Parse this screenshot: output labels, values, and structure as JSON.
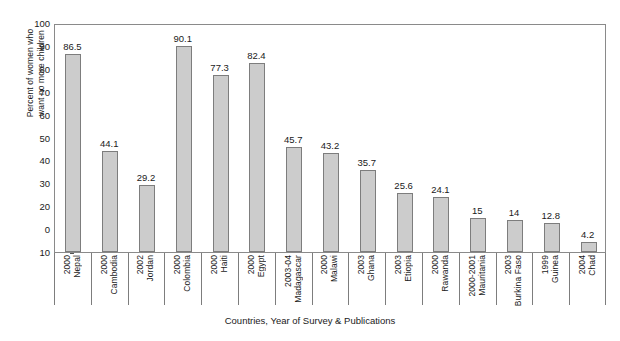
{
  "chart_data": {
    "type": "bar",
    "title": "",
    "xlabel": "Countries, Year of Survey & Publications",
    "ylabel": "Percent of women who want no more children",
    "ylabel_line1": "Percent of women who",
    "ylabel_line2": "want no more children",
    "grid": false,
    "legend": "none",
    "ylim": [
      0,
      100
    ],
    "ytick_labels": [
      "100",
      "90",
      "80",
      "70",
      "60",
      "50",
      "40",
      "30",
      "20",
      "0",
      "10"
    ],
    "ytick_values": [
      100,
      90,
      80,
      70,
      60,
      50,
      40,
      30,
      20,
      10,
      0
    ],
    "categories": [
      "2000 Nepal",
      "2000 Cambodia",
      "2002 Jordan",
      "2000 Colombia",
      "2000 Haiti",
      "2000 Egypt",
      "2003-04 Madagascar",
      "2000 Malawi",
      "2003 Ghana",
      "2003 Etiopia",
      "2000 Rawanda",
      "2000-2001 Mauritania",
      "2003 Burkina Faso",
      "1999 Guinea",
      "2004 Chad"
    ],
    "values": [
      86.5,
      44.1,
      29.2,
      90.1,
      77.3,
      82.4,
      45.7,
      43.2,
      35.7,
      25.6,
      24.1,
      15,
      14,
      12.8,
      4.2
    ],
    "value_labels": [
      "86.5",
      "44.1",
      "29.2",
      "90.1",
      "77.3",
      "82.4",
      "45.7",
      "43.2",
      "35.7",
      "25.6",
      "24.1",
      "15",
      "14",
      "12.8",
      "4.2"
    ],
    "bars": [
      {
        "year": "2000",
        "country": "Nepal",
        "value": 86.5,
        "label": "86.5"
      },
      {
        "year": "2000",
        "country": "Cambodia",
        "value": 44.1,
        "label": "44.1"
      },
      {
        "year": "2002",
        "country": "Jordan",
        "value": 29.2,
        "label": "29.2"
      },
      {
        "year": "2000",
        "country": "Colombia",
        "value": 90.1,
        "label": "90.1"
      },
      {
        "year": "2000",
        "country": "Haiti",
        "value": 77.3,
        "label": "77.3"
      },
      {
        "year": "2000",
        "country": "Egypt",
        "value": 82.4,
        "label": "82.4"
      },
      {
        "year": "2003-04",
        "country": "Madagascar",
        "value": 45.7,
        "label": "45.7"
      },
      {
        "year": "2000",
        "country": "Malawi",
        "value": 43.2,
        "label": "43.2"
      },
      {
        "year": "2003",
        "country": "Ghana",
        "value": 35.7,
        "label": "35.7"
      },
      {
        "year": "2003",
        "country": "Etiopia",
        "value": 25.6,
        "label": "25.6"
      },
      {
        "year": "2000",
        "country": "Rawanda",
        "value": 24.1,
        "label": "24.1"
      },
      {
        "year": "2000-2001",
        "country": "Mauritania",
        "value": 15,
        "label": "15"
      },
      {
        "year": "2003",
        "country": "Burkina Faso",
        "value": 14,
        "label": "14"
      },
      {
        "year": "1999",
        "country": "Guinea",
        "value": 12.8,
        "label": "12.8"
      },
      {
        "year": "2004",
        "country": "Chad",
        "value": 4.2,
        "label": "4.2"
      }
    ],
    "colors": {
      "bar_fill": "#cccccc",
      "bar_border": "#7d7d7d",
      "axis": "#8a8a8a",
      "text": "#1a1a1a",
      "background": "#ffffff"
    }
  }
}
